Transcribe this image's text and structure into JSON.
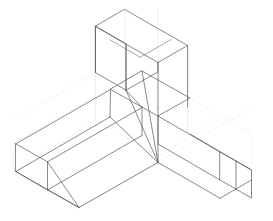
{
  "document": {
    "title": "Isometric Duct Fitting",
    "subject": "three-way-duct-transition-fitting",
    "projection": "isometric",
    "background_color": "#ffffff",
    "canvas": {
      "width": 273,
      "height": 221
    }
  },
  "line_styles": {
    "visible_edge": {
      "name": "visible-edge",
      "color": "#585858",
      "width": 0.7,
      "dash": "solid"
    },
    "visible_edge_soft": {
      "name": "visible-edge-soft",
      "color": "#7a7a7a",
      "width": 0.65,
      "dash": "solid"
    },
    "hidden_edge": {
      "name": "hidden-edge",
      "color": "#b9b9b9",
      "width": 0.6,
      "dash": "dotted"
    },
    "construction_edge": {
      "name": "construction-edge",
      "color": "#cccccc",
      "width": 0.55,
      "dash": "dotted"
    }
  },
  "geometry": {
    "vertical_branch": {
      "name": "vertical-riser-duct",
      "top_face": "M 124.8,9.5 L 187.6,45.5 L 158.0,62.5 L 95.4,26.5 Z",
      "top_divider": "M 140.2,57.3 L 171.0,39.5",
      "top_divider_2": "M 109.8,39.8 L 140.2,57.3",
      "front_left_face": "M 95.4,26.5 L 95.4,72.5 L 126.0,90.2 L 126.0,44.2 Z",
      "front_right_outline": "M 126.0,90.2 L 158.0,71.8 L 158.0,62.5",
      "right_vertical": "M 187.6,45.5 L 187.6,107.0",
      "left_vertical": "M 95.4,26.5 L 95.4,72.5",
      "mid_vertical": "M 126.0,44.2 L 126.0,90.2",
      "inner_vertical": "M 158.0,62.5 L 158.0,108.0"
    },
    "left_branch": {
      "name": "left-horizontal-duct",
      "end_face": "M 15.8,143.8 L 47.5,161.8 L 47.5,190.0 L 15.8,171.5 Z",
      "top_edge": "M 15.8,143.8 L 110.5,89.5",
      "bottom_edge": "M 47.5,190.0 L 142.0,135.5",
      "lower_edge": "M 15.8,171.5 L 110.0,117.0",
      "near_top_edge": "M 47.5,161.8 L 142.0,107.5",
      "end_diagonal_a": "M 47.5,161.8 L 79.0,207.5",
      "end_diagonal_b": "M 15.8,171.5 L 79.0,207.5",
      "end_diagonal_c": "M 47.5,190.0 L 79.0,207.5",
      "near_bottom_edge": "M 79.0,207.5 L 158.0,162.5"
    },
    "right_branch": {
      "name": "right-horizontal-duct",
      "end_face": "M 220.0,152.0 L 251.5,170.0 L 251.5,198.0 L 220.0,180.0 Z",
      "end_inner_divider": "M 236.0,161.2 L 236.0,189.2",
      "top_edge": "M 220.0,152.0 L 158.0,116.0",
      "near_bottom_edge": "M 220.0,180.0 L 158.0,144.0",
      "outer_top_edge": "M 251.5,170.0 L 190.0,134.0",
      "lower_long_edge": "M 158.0,162.5 L 220.0,198.2",
      "outer_lower_edge": "M 220.0,198.2 L 251.5,180.0"
    },
    "center_junction": {
      "name": "center-transition-junction",
      "top_plate": "M 110.5,89.5 L 158.0,116.0 L 190.0,98.0 L 142.0,71.0 Z",
      "front_left_edge": "M 110.5,89.5 L 110.0,117.0",
      "front_mid_edge": "M 142.0,107.5 L 142.0,135.5",
      "transition_a": "M 126.0,90.2 L 158.0,162.5",
      "transition_b": "M 158.0,108.0 L 158.0,162.5",
      "transition_c": "M 142.0,71.0 L 158.0,162.5",
      "transition_d": "M 110.0,117.0 L 158.0,162.5",
      "transition_e": "M 158.0,116.0 L 158.0,144.0",
      "fold_line": "M 126.0,90.2 L 142.0,107.5"
    },
    "hidden_construction": {
      "name": "hidden-construction-lines",
      "vertical_long_right": "M 187.6,45.5 L 187.6,134.0",
      "vertical_long_left": "M 95.4,26.5 L 95.4,120.0",
      "vertical_center": "M 124.8,9.5 L 124.8,44.2",
      "vertical_inner": "M 158.0,62.5 L 158.0,9.5",
      "top_back_left": "M 95.4,26.5 L 124.8,9.5",
      "top_back_right": "M 124.8,9.5 L 187.6,45.5",
      "back_plane_left": "M 14.0,143.0 L 95.4,96.0",
      "back_plane_right": "M 190.0,98.0 L 251.5,134.0",
      "floor_left": "M 15.8,171.5 L 95.4,120.0",
      "floor_center": "M 95.4,120.0 L 158.0,156.0",
      "floor_right": "M 158.0,156.0 L 220.0,120.0",
      "ghost_top_left": "M 95.4,72.5 L 14.5,119.5",
      "ghost_span": "M 110.5,89.5 L 190.0,43.5",
      "ghost_bottom_span": "M 79.0,207.5 L 251.5,108.0",
      "ghost_right_vertical": "M 251.5,134.0 L 251.5,198.0",
      "ghost_left_vertical": "M 14.0,143.0 L 14.0,171.8"
    }
  }
}
